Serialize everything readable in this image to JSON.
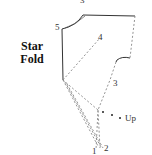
{
  "title": {
    "line1": "Star",
    "line2": "Fold"
  },
  "labels": {
    "top_cut": "3",
    "p5": "5",
    "p4": "4",
    "p3": "3",
    "p2": "2",
    "p1": "1",
    "up": "Up"
  },
  "colors": {
    "solid_line": "#333333",
    "dashed_line": "#888888",
    "text": "#111111",
    "background": "#ffffff"
  }
}
